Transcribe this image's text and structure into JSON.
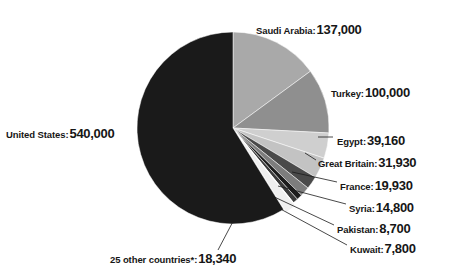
{
  "title_remnant": "2010 –11",
  "chart_data": {
    "type": "pie",
    "title": "",
    "subtitle": "",
    "xlabel": "",
    "ylabel": "",
    "legend_position": "callout-labels",
    "grid": false,
    "total": 917660,
    "start_angle_deg": 0,
    "direction": "clockwise",
    "categories": [
      "Saudi Arabia",
      "Turkey",
      "Egypt",
      "Great Britain",
      "France",
      "Syria",
      "Pakistan",
      "Kuwait",
      "25 other countries*",
      "United States"
    ],
    "values": [
      137000,
      100000,
      39160,
      31930,
      19930,
      14800,
      8700,
      7800,
      18340,
      540000
    ],
    "value_labels": [
      "137,000",
      "100,000",
      "39,160",
      "31,930",
      "19,930",
      "14,800",
      "8,700",
      "7,800",
      "18,340",
      "540,000"
    ],
    "colors": [
      "#a9a9a9",
      "#8f8f8f",
      "#cfcfcf",
      "#c3c3c3",
      "#4a4a4a",
      "#7d7d7d",
      "#1c1c1c",
      "#3a3a3a",
      "#efefef",
      "#1a1a1a"
    ],
    "slices": [
      {
        "name": "Saudi Arabia",
        "value": 137000,
        "value_label": "137,000",
        "color": "#a9a9a9",
        "exploded": false
      },
      {
        "name": "Turkey",
        "value": 100000,
        "value_label": "100,000",
        "color": "#8f8f8f",
        "exploded": false
      },
      {
        "name": "Egypt",
        "value": 39160,
        "value_label": "39,160",
        "color": "#cfcfcf",
        "exploded": false
      },
      {
        "name": "Great Britain",
        "value": 31930,
        "value_label": "31,930",
        "color": "#c3c3c3",
        "exploded": false
      },
      {
        "name": "France",
        "value": 19930,
        "value_label": "19,930",
        "color": "#4a4a4a",
        "exploded": false
      },
      {
        "name": "Syria",
        "value": 14800,
        "value_label": "14,800",
        "color": "#7d7d7d",
        "exploded": false
      },
      {
        "name": "Pakistan",
        "value": 8700,
        "value_label": "8,700",
        "color": "#1c1c1c",
        "exploded": false
      },
      {
        "name": "Kuwait",
        "value": 7800,
        "value_label": "7,800",
        "color": "#3a3a3a",
        "exploded": false
      },
      {
        "name": "25 other countries*",
        "value": 18340,
        "value_label": "18,340",
        "color": "#efefef",
        "exploded": true
      },
      {
        "name": "United States",
        "value": 540000,
        "value_label": "540,000",
        "color": "#1a1a1a",
        "exploded": false
      }
    ]
  },
  "labels": {
    "saudi_arabia": {
      "name": "Saudi Arabia:",
      "value": "137,000"
    },
    "turkey": {
      "name": "Turkey:",
      "value": "100,000"
    },
    "egypt": {
      "name": "Egypt:",
      "value": "39,160"
    },
    "great_britain": {
      "name": "Great Britain:",
      "value": "31,930"
    },
    "france": {
      "name": "France:",
      "value": "19,930"
    },
    "syria": {
      "name": "Syria:",
      "value": "14,800"
    },
    "pakistan": {
      "name": "Pakistan:",
      "value": "8,700"
    },
    "kuwait": {
      "name": "Kuwait:",
      "value": "7,800"
    },
    "united_states": {
      "name": "United States:",
      "value": "540,000"
    },
    "other": {
      "name": "25 other countries*:",
      "value": "18,340"
    }
  }
}
